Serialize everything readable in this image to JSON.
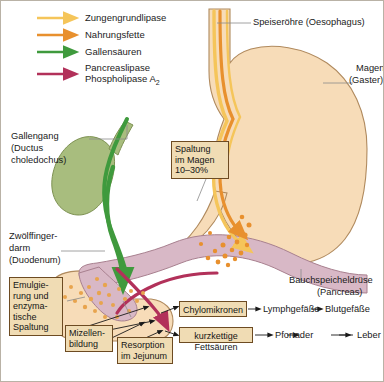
{
  "figure": {
    "frame_color": "#b9b2a6",
    "background": "#ffffff"
  },
  "legend": {
    "items": [
      {
        "label": "Zungengrundlipase",
        "color": "#f5c55a",
        "icon": "arrow-right-icon"
      },
      {
        "label": "Nahrungsfette",
        "color": "#e8902e",
        "icon": "arrow-right-icon"
      },
      {
        "label": "Gallensäuren",
        "color": "#3f9a3d",
        "icon": "arrow-right-icon"
      },
      {
        "label": "Pancreaslipase",
        "label2": "Phospholipase A",
        "sub": "2",
        "color": "#b2315a",
        "icon": "arrow-right-icon"
      }
    ]
  },
  "anatomy_labels": [
    {
      "name": "oesophagus",
      "line1": "Speiseröhre (Oesophagus)",
      "line2": ""
    },
    {
      "name": "stomach",
      "line1": "Magen",
      "line2": "(Gaster)"
    },
    {
      "name": "bile-duct",
      "line1": "Gallengang",
      "line2": "(Ductus",
      "line3": "choledochus)"
    },
    {
      "name": "duodenum",
      "line1": "Zwölffinger-",
      "line2": "darm",
      "line3": "(Duodenum)"
    },
    {
      "name": "pancreas",
      "line1": "Bauchspeicheldrüse",
      "line2": "(Pancreas)"
    }
  ],
  "callouts": [
    {
      "name": "gastric-cleavage",
      "lines": [
        "Spaltung",
        "im Magen",
        "10–30%"
      ]
    },
    {
      "name": "emulsification",
      "lines": [
        "Emulgie-",
        "rung und",
        "enzyma-",
        "tische",
        "Spaltung"
      ]
    },
    {
      "name": "micelle-formation",
      "lines": [
        "Mizellen-",
        "bildung"
      ]
    },
    {
      "name": "resorption",
      "lines": [
        "Resorption",
        "im Jejunum"
      ]
    },
    {
      "name": "chylomicrons",
      "lines": [
        "Chylomikronen"
      ]
    },
    {
      "name": "short-chain-fatty-acids",
      "lines": [
        "kurzkettige Fettsäuren"
      ]
    }
  ],
  "flow": {
    "lymph": "Lymphgefäße",
    "blood": "Blutgefäße",
    "portal": "Pfortader",
    "liver": "Leber"
  },
  "colors": {
    "stomach_fill": "#f7dcb8",
    "stomach_stroke": "#b08a5e",
    "pancreas_fill": "#d8b8c6",
    "pancreas_stroke": "#a8808f",
    "gallbladder_fill": "#a8bd7e",
    "gallbladder_stroke": "#7d9152",
    "bile_green": "#3f9a3d",
    "lipase_yellow": "#f5c55a",
    "fat_orange": "#e8902e",
    "pancreas_red": "#b2315a",
    "box_fill": "#f0dcb4",
    "box_border": "#6d4b22",
    "leader": "#7a7a7a"
  }
}
